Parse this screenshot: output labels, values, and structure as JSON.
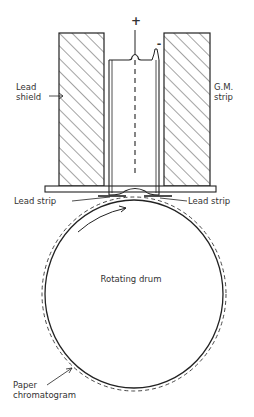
{
  "diagram": {
    "labels": {
      "anode_sign": "+",
      "cathode_sign": "-",
      "lead_shield_line1": "Lead",
      "lead_shield_line2": "shield",
      "gm_strip_line1": "G.M.",
      "gm_strip_line2": "strip",
      "lead_strip_left": "Lead strip",
      "lead_strip_right": "Lead strip",
      "drum": "Rotating drum",
      "paper_line1": "Paper",
      "paper_line2": "chromatogram"
    },
    "colors": {
      "line": "#222222",
      "background": "#ffffff"
    }
  }
}
